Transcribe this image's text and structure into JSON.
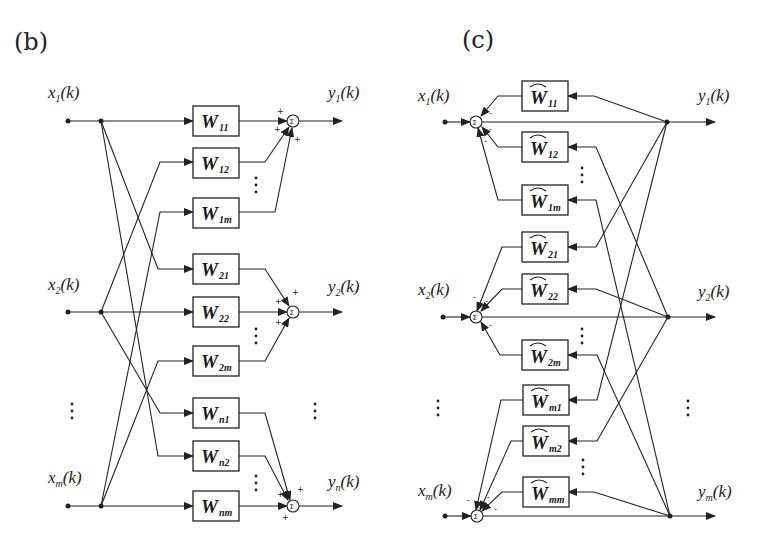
{
  "panels": {
    "b": {
      "label": "(b)",
      "inputs": [
        {
          "name": "x",
          "sub": "1",
          "arg": "(k)"
        },
        {
          "name": "x",
          "sub": "2",
          "arg": "(k)"
        },
        {
          "name": "x",
          "sub": "m",
          "arg": "(k)"
        }
      ],
      "outputs": [
        {
          "name": "y",
          "sub": "1",
          "arg": "(k)"
        },
        {
          "name": "y",
          "sub": "2",
          "arg": "(k)"
        },
        {
          "name": "y",
          "sub": "n",
          "arg": "(k)"
        }
      ],
      "blocks": [
        {
          "name": "W",
          "sub": "11"
        },
        {
          "name": "W",
          "sub": "12"
        },
        {
          "name": "W",
          "sub": "1m"
        },
        {
          "name": "W",
          "sub": "21"
        },
        {
          "name": "W",
          "sub": "22"
        },
        {
          "name": "W",
          "sub": "2m"
        },
        {
          "name": "W",
          "sub": "n1"
        },
        {
          "name": "W",
          "sub": "n2"
        },
        {
          "name": "W",
          "sub": "nm"
        }
      ],
      "sum_symbol": "Σ",
      "sum_sign": "+",
      "ellipsis": "⋮"
    },
    "c": {
      "label": "(c)",
      "inputs": [
        {
          "name": "x",
          "sub": "1",
          "arg": "(k)"
        },
        {
          "name": "x",
          "sub": "2",
          "arg": "(k)"
        },
        {
          "name": "x",
          "sub": "m",
          "arg": "(k)"
        }
      ],
      "outputs": [
        {
          "name": "y",
          "sub": "1",
          "arg": "(k)"
        },
        {
          "name": "y",
          "sub": "2",
          "arg": "(k)"
        },
        {
          "name": "y",
          "sub": "m",
          "arg": "(k)"
        }
      ],
      "blocks": [
        {
          "name": "Ŵ",
          "sub": "11"
        },
        {
          "name": "Ŵ",
          "sub": "12"
        },
        {
          "name": "Ŵ",
          "sub": "1m"
        },
        {
          "name": "Ŵ",
          "sub": "21"
        },
        {
          "name": "Ŵ",
          "sub": "22"
        },
        {
          "name": "Ŵ",
          "sub": "2m"
        },
        {
          "name": "Ŵ",
          "sub": "m1"
        },
        {
          "name": "Ŵ",
          "sub": "m2"
        },
        {
          "name": "Ŵ",
          "sub": "mm"
        }
      ],
      "sum_symbol": "Σ",
      "sum_sign": "-",
      "ellipsis": "⋮"
    }
  }
}
